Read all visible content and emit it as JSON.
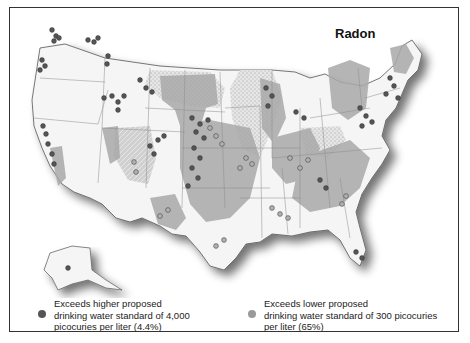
{
  "map": {
    "title": "Radon",
    "region": "United States (contiguous + Alaska)",
    "colors": {
      "background": "#ffffff",
      "land": "#f4f4f4",
      "shaded_area": "#a8a8a8",
      "stippled_area": "#dcdcdc",
      "border": "#333333",
      "state_lines": "#888888",
      "dot_high": "#4a4a4a",
      "dot_low": "#9a9a9a"
    }
  },
  "legend": {
    "items": [
      {
        "label": "Exceeds higher proposed\ndrinking water standard of 4,000\npicocuries per liter (4.4%)",
        "color": "#555555",
        "threshold": "4,000 picocuries per liter",
        "percent": "4.4%"
      },
      {
        "label": "Exceeds lower proposed\ndrinking water standard of 300 picocuries\nper liter (65%)",
        "color": "#9a9a9a",
        "threshold": "300 picocuries per liter",
        "percent": "65%"
      }
    ]
  }
}
